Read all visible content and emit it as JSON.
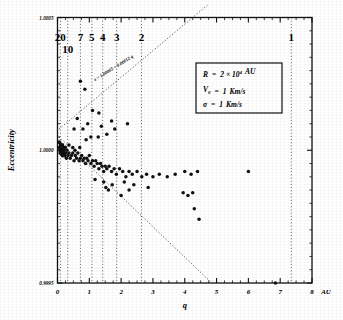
{
  "figure": {
    "kind": "scatter-plot",
    "background": "#ffffff",
    "ink_color": "#111111"
  },
  "chart_data": {
    "type": "scatter",
    "title": "",
    "xlabel": "q",
    "ylabel": "Eccentricity",
    "x_unit": "AU",
    "xlim": [
      0,
      8
    ],
    "ylim": [
      0.9995,
      1.0005
    ],
    "grid": false,
    "x_ticks": [
      0,
      1,
      2,
      3,
      4,
      5,
      6,
      7,
      8
    ],
    "x_tick_labels": [
      "0",
      "1",
      "2",
      "3",
      "4",
      "5",
      "6",
      "7",
      "8"
    ],
    "x_minor_tick_step": 0.25,
    "y_ticks": [
      0.9995,
      1.0,
      1.0005
    ],
    "y_tick_labels": [
      "0.9995",
      "1.0000",
      "1.0005"
    ],
    "y_minor_tick_step": 5e-05,
    "top_axis_label_title": "",
    "top_period_lines": [
      {
        "label": "20",
        "q": 0.09
      },
      {
        "label": "10",
        "q": 0.32
      },
      {
        "label": "7",
        "q": 0.72
      },
      {
        "label": "5",
        "q": 1.08
      },
      {
        "label": "4",
        "q": 1.42
      },
      {
        "label": "3",
        "q": 1.86
      },
      {
        "label": "2",
        "q": 2.64
      },
      {
        "label": "1",
        "q": 7.35
      }
    ],
    "annotations": [
      {
        "name": "fit-line-equation",
        "text": "e = 1.00005 + 0.00012 q",
        "rotation": -32
      }
    ],
    "parameter_box": {
      "rows": [
        {
          "symbol": "R",
          "eq": "=",
          "value": "2 × 10",
          "exponent": "4",
          "unit": "AU"
        },
        {
          "symbol": "V",
          "subscript": "0",
          "eq": "=",
          "value": "1",
          "unit": "Km/s"
        },
        {
          "symbol": "σ",
          "eq": "=",
          "value": "1",
          "unit": "Km/s"
        }
      ]
    },
    "boundary_lines": [
      {
        "name": "upper-envelope",
        "points": [
          [
            0.05,
            1.00008
          ],
          [
            4.75,
            1.00055
          ]
        ]
      },
      {
        "name": "lower-envelope",
        "points": [
          [
            0.05,
            1.00005
          ],
          [
            4.85,
            0.9995
          ]
        ]
      }
    ],
    "series": [
      {
        "name": "comets",
        "marker": "filled-circle",
        "color": "#111111",
        "points": [
          [
            0.06,
            1.00003
          ],
          [
            0.07,
            1.00001
          ],
          [
            0.08,
            1.0
          ],
          [
            0.09,
            0.99999
          ],
          [
            0.1,
            1.00002
          ],
          [
            0.11,
            1.0
          ],
          [
            0.12,
            1.00001
          ],
          [
            0.13,
            0.99999
          ],
          [
            0.14,
            1.0
          ],
          [
            0.15,
            1.00002
          ],
          [
            0.16,
            0.99998
          ],
          [
            0.17,
            1.00001
          ],
          [
            0.18,
            1.0
          ],
          [
            0.19,
            0.99999
          ],
          [
            0.2,
            1.0
          ],
          [
            0.22,
            0.99998
          ],
          [
            0.24,
            1.00001
          ],
          [
            0.26,
            0.99999
          ],
          [
            0.28,
            0.99997
          ],
          [
            0.3,
            1.0
          ],
          [
            0.33,
            0.99998
          ],
          [
            0.36,
            0.99999
          ],
          [
            0.4,
            0.99997
          ],
          [
            0.44,
            0.99998
          ],
          [
            0.48,
            0.99999
          ],
          [
            0.52,
            0.99996
          ],
          [
            0.56,
            0.99998
          ],
          [
            0.6,
            0.99997
          ],
          [
            0.64,
            0.99999
          ],
          [
            0.68,
            0.99996
          ],
          [
            0.72,
            0.99997
          ],
          [
            0.76,
            0.99998
          ],
          [
            0.8,
            0.99996
          ],
          [
            0.84,
            0.99997
          ],
          [
            0.88,
            0.99995
          ],
          [
            0.92,
            0.99997
          ],
          [
            0.96,
            0.99996
          ],
          [
            1.0,
            0.99998
          ],
          [
            1.05,
            0.99995
          ],
          [
            1.1,
            0.99996
          ],
          [
            1.15,
            0.99994
          ],
          [
            1.2,
            0.99996
          ],
          [
            1.25,
            0.99995
          ],
          [
            1.3,
            0.99993
          ],
          [
            1.35,
            0.99995
          ],
          [
            1.4,
            0.99994
          ],
          [
            1.45,
            0.99992
          ],
          [
            1.5,
            0.99994
          ],
          [
            1.55,
            0.99993
          ],
          [
            1.62,
            0.99994
          ],
          [
            1.7,
            0.99992
          ],
          [
            1.78,
            0.99993
          ],
          [
            1.85,
            0.99991
          ],
          [
            1.95,
            0.99993
          ],
          [
            2.05,
            0.99992
          ],
          [
            2.15,
            0.9999
          ],
          [
            2.25,
            0.99992
          ],
          [
            2.35,
            0.99991
          ],
          [
            2.5,
            0.99992
          ],
          [
            2.65,
            0.9999
          ],
          [
            2.8,
            0.99991
          ],
          [
            3.0,
            0.9999
          ],
          [
            3.2,
            0.99991
          ],
          [
            3.45,
            0.9999
          ],
          [
            3.7,
            0.99991
          ],
          [
            4.0,
            0.99992
          ],
          [
            4.2,
            0.99991
          ],
          [
            4.4,
            0.99992
          ],
          [
            6.0,
            0.99992
          ],
          [
            0.62,
            1.00012
          ],
          [
            0.72,
            1.00026
          ],
          [
            0.86,
            1.00023
          ],
          [
            1.1,
            1.00015
          ],
          [
            1.3,
            1.00014
          ],
          [
            1.38,
            1.00009
          ],
          [
            0.95,
            1.0001
          ],
          [
            0.8,
            1.00008
          ],
          [
            0.52,
            1.00008
          ],
          [
            1.7,
            1.00011
          ],
          [
            1.8,
            1.00008
          ],
          [
            2.2,
            1.0001
          ],
          [
            1.55,
            1.00006
          ],
          [
            1.28,
            1.00005
          ],
          [
            1.05,
            1.00005
          ],
          [
            0.9,
            1.00004
          ],
          [
            1.72,
            0.99987
          ],
          [
            1.52,
            0.99986
          ],
          [
            1.6,
            0.99985
          ],
          [
            2.0,
            0.99983
          ],
          [
            2.25,
            0.99985
          ],
          [
            2.4,
            0.99987
          ],
          [
            2.85,
            0.99986
          ],
          [
            3.95,
            0.99984
          ],
          [
            4.1,
            0.99983
          ],
          [
            4.25,
            0.99984
          ],
          [
            4.3,
            0.99978
          ],
          [
            4.45,
            0.99974
          ],
          [
            6.85,
            0.9995
          ],
          [
            2.1,
            0.99988
          ],
          [
            1.18,
            0.99989
          ],
          [
            0.48,
            1.00001
          ],
          [
            0.36,
            1.00002
          ],
          [
            0.55,
            1.0
          ],
          [
            0.7,
            1.00001
          ],
          [
            1.45,
            0.99988
          ]
        ]
      }
    ]
  }
}
